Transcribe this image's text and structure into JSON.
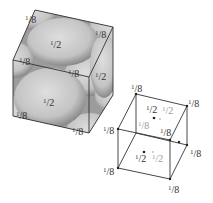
{
  "figure": {
    "large_cube": {
      "labels": [
        {
          "id": "top-back-left",
          "text": "1/8",
          "x": 25,
          "y": 13
        },
        {
          "id": "top-back-right",
          "text": "1/8",
          "x": 95,
          "y": 28
        },
        {
          "id": "top-face-center",
          "text": "1/2",
          "x": 50,
          "y": 38
        },
        {
          "id": "top-front-left",
          "text": "1/8",
          "x": 19,
          "y": 55
        },
        {
          "id": "top-front-right",
          "text": "1/8",
          "x": 68,
          "y": 67
        },
        {
          "id": "right-face-center",
          "text": "1/2",
          "x": 95,
          "y": 70
        },
        {
          "id": "front-face-center",
          "text": "1/2",
          "x": 43,
          "y": 96
        },
        {
          "id": "bottom-front-left",
          "text": "1/8",
          "x": 16,
          "y": 109
        },
        {
          "id": "bottom-front-right",
          "text": "1/8",
          "x": 72,
          "y": 125
        }
      ]
    },
    "small_cube": {
      "labels": [
        {
          "id": "back-top-left",
          "text": "1/8",
          "x": 131,
          "y": 82,
          "gray": false
        },
        {
          "id": "back-top-right",
          "text": "1/8",
          "x": 188,
          "y": 97,
          "gray": false
        },
        {
          "id": "top-face-center",
          "text": "1/2",
          "x": 146,
          "y": 103,
          "gray": false
        },
        {
          "id": "top-face-center-hidden",
          "text": "1/2",
          "x": 162,
          "y": 104,
          "gray": true
        },
        {
          "id": "back-bottom-left",
          "text": "1/8",
          "x": 138,
          "y": 119,
          "gray": true
        },
        {
          "id": "front-top-left",
          "text": "1/8",
          "x": 103,
          "y": 124,
          "gray": false
        },
        {
          "id": "front-top-right",
          "text": "1/8",
          "x": 160,
          "y": 126,
          "gray": false
        },
        {
          "id": "back-bottom-right",
          "text": "1/8",
          "x": 190,
          "y": 147,
          "gray": false
        },
        {
          "id": "front-face-center",
          "text": "1/2",
          "x": 135,
          "y": 152,
          "gray": false
        },
        {
          "id": "back-face-center",
          "text": "1/2",
          "x": 152,
          "y": 152,
          "gray": true
        },
        {
          "id": "front-bottom-left",
          "text": "1/8",
          "x": 103,
          "y": 165,
          "gray": false
        },
        {
          "id": "front-bottom-right",
          "text": "1/8",
          "x": 168,
          "y": 183,
          "gray": false
        }
      ]
    },
    "colors": {
      "sphere_fill": "#cfcfcf",
      "sphere_shadow": "#8d8d8d",
      "edge": "#333333",
      "gray_label": "#9a9a9a"
    }
  }
}
